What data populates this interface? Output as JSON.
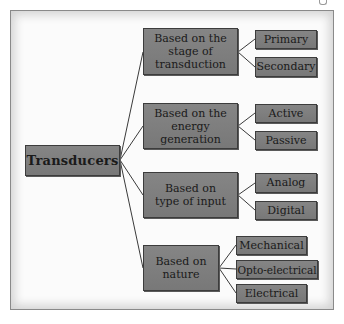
{
  "diagram": {
    "root": {
      "label": "Transducers"
    },
    "categories": [
      {
        "label": "Based on the stage of transduction",
        "children": [
          "Primary",
          "Secondary"
        ]
      },
      {
        "label": "Based on the energy generation",
        "children": [
          "Active",
          "Passive"
        ]
      },
      {
        "label": "Based on type of input",
        "children": [
          "Analog",
          "Digital"
        ]
      },
      {
        "label": "Based on nature",
        "children": [
          "Mechanical",
          "Opto-electrical",
          "Electrical"
        ]
      }
    ],
    "colors": {
      "box_fill": "#7d7d7d",
      "box_border": "#3c3c3c",
      "line": "#3a3a3a",
      "frame_bg": "#fbfbfb"
    }
  }
}
